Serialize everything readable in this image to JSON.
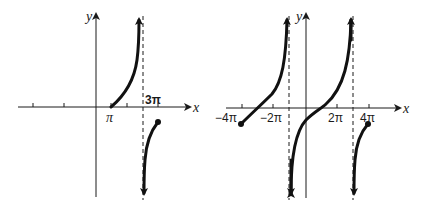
{
  "figure": {
    "left_graph": {
      "x_axis_label": "x",
      "y_axis_label": "y",
      "tick_labels": {
        "pi": "π",
        "three_pi": "3π"
      },
      "asymptote": "x = 3π",
      "branches": [
        {
          "from": "π",
          "to": "3π",
          "direction": "increasing to +∞",
          "start_on_axis": true
        },
        {
          "from": "3π",
          "to": "endpoint (closed dot)",
          "direction": "from -∞ increasing to endpoint"
        }
      ]
    },
    "right_graph": {
      "x_axis_label": "x",
      "y_axis_label": "y",
      "tick_labels": {
        "neg_four_pi": "−4π",
        "neg_two_pi": "−2π",
        "two_pi": "2π",
        "four_pi": "4π"
      },
      "asymptotes": [
        "x = −π",
        "x = 3π"
      ],
      "branches": [
        {
          "from": "−4π (closed dot)",
          "to": "−π",
          "direction": "increasing to +∞"
        },
        {
          "from": "−π",
          "to": "3π",
          "direction": "increasing from −∞ to +∞, crosses x-axis near π"
        },
        {
          "from": "3π",
          "to": "4π (closed dot)",
          "direction": "increasing from −∞ to endpoint"
        }
      ]
    }
  }
}
